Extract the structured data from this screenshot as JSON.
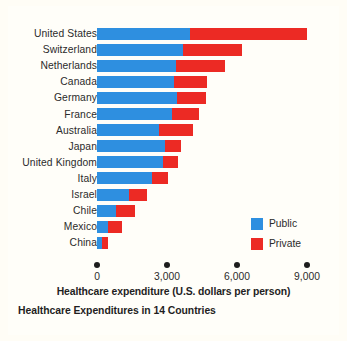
{
  "chart_data": {
    "type": "bar",
    "orientation": "horizontal",
    "stacked": true,
    "title": "Healthcare Expenditures in 14 Countries",
    "xlabel": "Healthcare expenditure (U.S. dollars per person)",
    "ylabel": "",
    "xlim": [
      0,
      9000
    ],
    "xticks": [
      0,
      3000,
      6000,
      9000
    ],
    "xtick_labels": [
      "0",
      "3,000",
      "6,000",
      "9,000"
    ],
    "grid": false,
    "legend_position": "inside-right",
    "categories": [
      "United States",
      "Switzerland",
      "Netherlands",
      "Canada",
      "Germany",
      "France",
      "Australia",
      "Japan",
      "United Kingdom",
      "Italy",
      "Israel",
      "Chile",
      "Mexico",
      "China"
    ],
    "series": [
      {
        "name": "Public",
        "color": "#2e8fe0",
        "values": [
          4000,
          3700,
          3380,
          3280,
          3420,
          3200,
          2650,
          2900,
          2820,
          2340,
          1370,
          800,
          470,
          210
        ]
      },
      {
        "name": "Private",
        "color": "#ec2a24",
        "values": [
          5000,
          2500,
          2100,
          1420,
          1240,
          1160,
          1450,
          690,
          640,
          690,
          770,
          820,
          600,
          250
        ]
      }
    ],
    "totals": [
      9000,
      6200,
      5480,
      4700,
      4660,
      4360,
      4100,
      3590,
      3460,
      3030,
      2140,
      1620,
      1070,
      460
    ]
  },
  "legend": {
    "items": [
      {
        "label": "Public",
        "color": "#2e8fe0"
      },
      {
        "label": "Private",
        "color": "#ec2a24"
      }
    ]
  }
}
